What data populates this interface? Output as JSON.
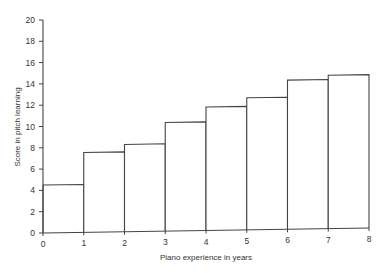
{
  "chart_data": {
    "type": "bar",
    "subtype": "histogram",
    "title": "",
    "xlabel": "Piano experience in years",
    "ylabel": "Score in pitch learning",
    "x_ticks": [
      "0",
      "1",
      "2",
      "3",
      "4",
      "5",
      "6",
      "7",
      "8"
    ],
    "y_ticks": [
      "0",
      "2",
      "4",
      "6",
      "8",
      "10",
      "12",
      "14",
      "16",
      "18",
      "20"
    ],
    "categories": [
      "0-1",
      "1-2",
      "2-3",
      "3-4",
      "4-5",
      "5-6",
      "6-7",
      "7-8"
    ],
    "bins": [
      [
        0,
        1
      ],
      [
        1,
        2
      ],
      [
        2,
        3
      ],
      [
        3,
        4
      ],
      [
        4,
        5
      ],
      [
        5,
        6
      ],
      [
        6,
        7
      ],
      [
        7,
        8
      ]
    ],
    "values": [
      4.5,
      7.5,
      8.2,
      10.2,
      11.6,
      12.4,
      14.0,
      14.4
    ],
    "xlim": [
      0,
      8
    ],
    "ylim": [
      0,
      20
    ],
    "grid": false,
    "legend": null,
    "colors": {
      "line": "#444444",
      "fill": "#ffffff",
      "text": "#333333"
    }
  }
}
